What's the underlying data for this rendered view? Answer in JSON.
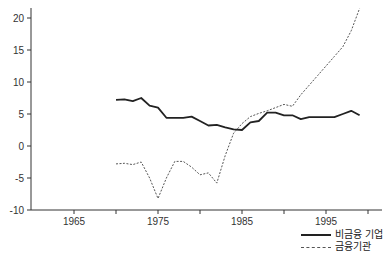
{
  "chart_data": {
    "type": "line",
    "title": "",
    "xlabel": "",
    "ylabel": "",
    "xlim": [
      1960,
      2000
    ],
    "ylim": [
      -10,
      22
    ],
    "grid": false,
    "legend_position": "bottom-right",
    "x_ticks": [
      1965,
      1975,
      1985,
      1995
    ],
    "x_minor_ticks": [
      1970,
      1980,
      1990,
      2000
    ],
    "y_ticks": [
      20,
      15,
      10,
      5,
      0,
      -5,
      -10
    ],
    "x": [
      1970,
      1971,
      1972,
      1973,
      1974,
      1975,
      1976,
      1977,
      1978,
      1979,
      1980,
      1981,
      1982,
      1983,
      1984,
      1985,
      1986,
      1987,
      1988,
      1989,
      1990,
      1991,
      1992,
      1993,
      1994,
      1995,
      1996,
      1997,
      1998,
      1999
    ],
    "series": [
      {
        "name": "비금융 기업",
        "style": "solid",
        "color": "#222222",
        "values": [
          7.2,
          7.3,
          7.0,
          7.5,
          6.3,
          6.0,
          4.4,
          4.4,
          4.4,
          4.6,
          3.9,
          3.2,
          3.3,
          2.9,
          2.6,
          2.5,
          3.7,
          3.9,
          5.2,
          5.2,
          4.8,
          4.8,
          4.2,
          4.5,
          4.5,
          4.5,
          4.5,
          5.0,
          5.5,
          4.8
        ]
      },
      {
        "name": "금융기관",
        "style": "dashed",
        "color": "#555555",
        "values": [
          -2.8,
          -2.7,
          -2.9,
          -2.5,
          -5.0,
          -8.2,
          -5.0,
          -2.4,
          -2.4,
          -3.3,
          -4.5,
          -4.2,
          -5.8,
          -1.5,
          2.0,
          3.5,
          4.6,
          5.1,
          5.5,
          6.0,
          6.5,
          6.2,
          8.0,
          9.5,
          11.0,
          12.5,
          14.0,
          15.5,
          18.0,
          21.5
        ]
      }
    ]
  },
  "legend": {
    "items": [
      {
        "label": "비금융 기업"
      },
      {
        "label": "금융기관"
      }
    ]
  }
}
